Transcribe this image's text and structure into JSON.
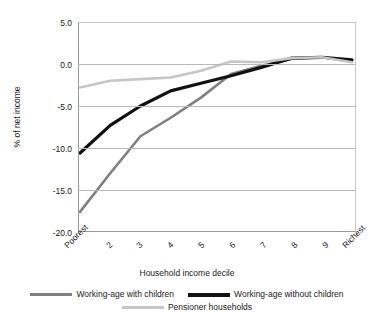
{
  "chart_data": {
    "type": "line",
    "title": "",
    "xlabel": "Household income decile",
    "ylabel": "% of net income",
    "categories": [
      "Poorest",
      "2",
      "3",
      "4",
      "5",
      "6",
      "7",
      "8",
      "9",
      "Richest"
    ],
    "ylim": [
      -20.0,
      5.0
    ],
    "ytick_labels": [
      "5.0",
      "0.0",
      "-5.0",
      "-10.0",
      "-15.0",
      "-20.0"
    ],
    "ytick_values": [
      5.0,
      0.0,
      -5.0,
      -10.0,
      -15.0,
      -20.0
    ],
    "grid": "horizontal",
    "legend_position": "bottom",
    "series": [
      {
        "name": "Working-age with children",
        "color": "#808080",
        "values": [
          -17.6,
          -13.0,
          -8.6,
          -6.4,
          -4.0,
          -1.2,
          -0.2,
          0.6,
          0.8,
          0.3
        ]
      },
      {
        "name": "Working-age without children",
        "color": "#111111",
        "values": [
          -10.6,
          -7.3,
          -5.0,
          -3.2,
          -2.3,
          -1.4,
          -0.4,
          0.7,
          0.8,
          0.5
        ]
      },
      {
        "name": "Pensioner households",
        "color": "#c6c6c6",
        "values": [
          -2.8,
          -2.0,
          -1.8,
          -1.6,
          -0.8,
          0.3,
          0.2,
          0.7,
          0.8,
          0.2
        ]
      }
    ]
  },
  "axes": {
    "y_title": "% of net income",
    "x_title": "Household income decile"
  },
  "legend": {
    "items": [
      {
        "label": "Working-age with children",
        "swatch": "line-swatch-grey"
      },
      {
        "label": "Working-age without children",
        "swatch": "line-swatch-black"
      },
      {
        "label": "Pensioner households",
        "swatch": "line-swatch-light-grey"
      }
    ]
  }
}
